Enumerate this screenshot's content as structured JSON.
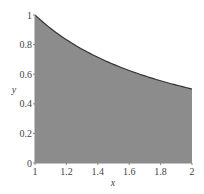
{
  "chart_data": {
    "type": "area",
    "title": "",
    "xlabel": "x",
    "ylabel": "y",
    "function": "y = 1/x",
    "xlim": [
      1,
      2
    ],
    "ylim": [
      0,
      1
    ],
    "grid": false,
    "legend": null,
    "x": [
      1.0,
      1.1,
      1.2,
      1.3,
      1.4,
      1.5,
      1.6,
      1.7,
      1.8,
      1.9,
      2.0
    ],
    "series": [
      {
        "name": "1/x",
        "values": [
          1.0,
          0.909,
          0.833,
          0.769,
          0.714,
          0.667,
          0.625,
          0.588,
          0.556,
          0.526,
          0.5
        ],
        "fill_color": "#8c8c8c",
        "line_color": "#333333"
      }
    ],
    "x_ticks": [
      "1",
      "1.2",
      "1.4",
      "1.6",
      "1.8",
      "2"
    ],
    "y_ticks": [
      "0",
      "0.2",
      "0.4",
      "0.6",
      "0.8",
      "1"
    ]
  },
  "colors": {
    "fill": "#8c8c8c",
    "curve": "#333333",
    "axis": "#888888",
    "text": "#444444"
  }
}
